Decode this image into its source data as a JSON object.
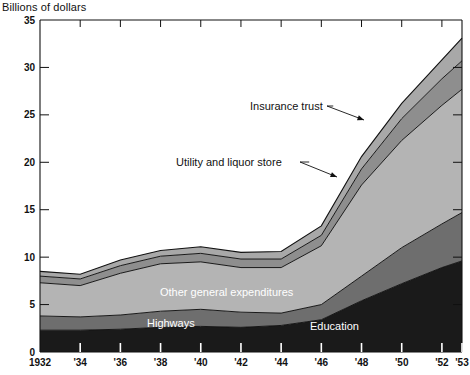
{
  "chart_data": {
    "type": "area",
    "stacked": true,
    "title": "",
    "ylabel": "Billions of dollars",
    "xlabel": "",
    "ylim": [
      0,
      35
    ],
    "yticks": [
      0,
      5,
      10,
      15,
      20,
      25,
      30,
      35
    ],
    "ytick_labels": [
      "0",
      "5",
      "10",
      "15",
      "20",
      "25",
      "30",
      "35"
    ],
    "xlim": [
      1932,
      1953
    ],
    "xticks": [
      1932,
      1934,
      1936,
      1938,
      1940,
      1942,
      1944,
      1946,
      1948,
      1950,
      1952,
      1953
    ],
    "xtick_labels": [
      "1932",
      "'34",
      "'36",
      "'38",
      "'40",
      "'42",
      "'44",
      "'46",
      "'48",
      "'50",
      "'52",
      "'53"
    ],
    "x": [
      1932,
      1934,
      1936,
      1938,
      1940,
      1942,
      1944,
      1946,
      1948,
      1950,
      1952,
      1953
    ],
    "grid": false,
    "legend_position": "inline-annotations",
    "series": [
      {
        "name": "Education",
        "color": "#1a1a1a",
        "label_color": "#ffffff",
        "values": [
          2.3,
          2.3,
          2.4,
          2.6,
          2.7,
          2.6,
          2.8,
          3.4,
          5.4,
          7.2,
          8.9,
          9.6
        ]
      },
      {
        "name": "Highways",
        "color": "#6e6e6e",
        "label_color": "#ffffff",
        "values": [
          1.5,
          1.4,
          1.5,
          1.7,
          1.8,
          1.6,
          1.3,
          1.6,
          2.6,
          3.8,
          4.6,
          5.1
        ]
      },
      {
        "name": "Other general expenditures",
        "color": "#b4b4b4",
        "label_color": "#ffffff",
        "values": [
          3.5,
          3.3,
          4.4,
          5.0,
          5.0,
          4.7,
          4.8,
          6.2,
          9.6,
          11.3,
          12.5,
          13.0
        ]
      },
      {
        "name": "Utility and liquor store",
        "color": "#8e8e8e",
        "label_color": "#111111",
        "values": [
          0.7,
          0.7,
          0.8,
          0.8,
          0.9,
          0.9,
          0.9,
          1.1,
          1.7,
          2.3,
          2.8,
          3.0
        ]
      },
      {
        "name": "Insurance trust",
        "color": "#a8a8a8",
        "label_color": "#111111",
        "values": [
          0.5,
          0.5,
          0.6,
          0.6,
          0.7,
          0.7,
          0.8,
          1.0,
          1.3,
          1.6,
          2.0,
          2.4
        ]
      }
    ],
    "totals": [
      8.5,
      8.2,
      9.7,
      10.7,
      11.1,
      10.5,
      10.6,
      13.3,
      20.6,
      26.2,
      30.8,
      33.1
    ],
    "annotations": [
      {
        "text": "Insurance trust",
        "type": "callout",
        "text_x": 250,
        "text_y": 110,
        "line": [
          [
            327,
            106
          ],
          [
            364,
            120
          ]
        ]
      },
      {
        "text": "Utility and liquor store",
        "type": "callout",
        "text_x": 176,
        "text_y": 166,
        "line": [
          [
            300,
            162
          ],
          [
            337,
            177
          ]
        ]
      },
      {
        "text": "Other general expenditures",
        "type": "inline",
        "text_x": 160,
        "text_y": 296
      },
      {
        "text": "Highways",
        "type": "inline",
        "text_x": 147,
        "text_y": 327
      },
      {
        "text": "Education",
        "type": "inline",
        "text_x": 310,
        "text_y": 330
      }
    ]
  }
}
